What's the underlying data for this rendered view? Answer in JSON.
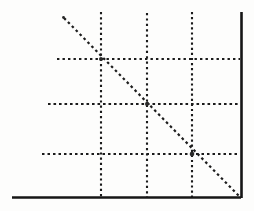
{
  "figure": {
    "title": "Dotted line graph with grid",
    "background_color": "#fdfdfc",
    "ink_color": "#1b1b1b",
    "axis_color": "#161616",
    "width": 254,
    "height": 211
  },
  "chart_data": {
    "type": "line",
    "title": "",
    "subtitle": "",
    "xlabel": "",
    "ylabel": "",
    "xlim": [
      0,
      4
    ],
    "ylim": [
      0,
      4
    ],
    "grid": true,
    "legend": "none",
    "tick_labels": {
      "x": [
        "",
        "",
        "",
        ""
      ],
      "y": [
        "",
        "",
        "",
        ""
      ]
    },
    "x": [
      0.22,
      1,
      2,
      3,
      4
    ],
    "series": [
      {
        "name": "descending-line",
        "style": "dotted",
        "values": [
          3.78,
          3,
          2,
          1,
          0
        ]
      }
    ],
    "annotations": [],
    "gridlines": {
      "vertical_x": [
        1,
        2,
        3
      ],
      "horizontal_y": [
        1,
        2,
        3
      ]
    }
  },
  "geometry": {
    "axes": {
      "x_axis": {
        "x1": 12,
        "y1": 197.5,
        "x2": 241,
        "y2": 197.5,
        "width": 2.6
      },
      "y_axis": {
        "x1": 241.5,
        "y1": 12,
        "x2": 241.5,
        "y2": 198,
        "width": 2.6
      }
    },
    "vertical_gridlines": [
      {
        "x": 101,
        "y1": 12,
        "y2": 197
      },
      {
        "x": 147,
        "y1": 13,
        "y2": 197
      },
      {
        "x": 192,
        "y1": 12,
        "y2": 197
      }
    ],
    "horizontal_gridlines": [
      {
        "y": 59,
        "x1": 57,
        "x2": 240
      },
      {
        "y": 104,
        "x1": 48,
        "x2": 240
      },
      {
        "y": 154,
        "x1": 42,
        "x2": 240
      }
    ],
    "diagonal": {
      "x1": 64,
      "y1": 18,
      "x2": 240,
      "y2": 197
    },
    "specks": [
      {
        "x": 63,
        "y": 17,
        "r": 1.4
      },
      {
        "x": 238,
        "y": 195,
        "r": 1.6
      },
      {
        "x": 101,
        "y": 59,
        "r": 2.0
      },
      {
        "x": 147,
        "y": 104,
        "r": 2.0
      },
      {
        "x": 192,
        "y": 154,
        "r": 2.2
      }
    ]
  }
}
